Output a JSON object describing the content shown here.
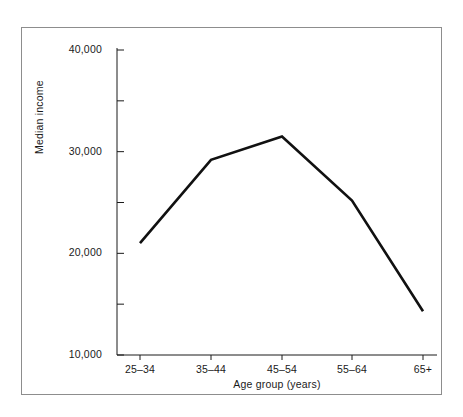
{
  "chart_data": {
    "type": "line",
    "title": "",
    "xlabel": "Age group (years)",
    "ylabel": "Median income",
    "categories": [
      "25–34",
      "35–44",
      "45–54",
      "55–64",
      "65+"
    ],
    "values": [
      21000,
      29200,
      31500,
      25200,
      14300
    ],
    "series": [
      {
        "name": "Median income",
        "values": [
          21000,
          29200,
          31500,
          25200,
          14300
        ]
      }
    ],
    "ylim": [
      10000,
      40000
    ],
    "ytick_values": [
      10000,
      20000,
      30000,
      40000
    ],
    "ytick_labels": [
      "10,000",
      "20,000",
      "30,000",
      "40,000"
    ],
    "yminor_tick_values": [
      15000,
      25000,
      35000
    ],
    "grid": false,
    "legend": false,
    "legend_position": "none",
    "line_color": "#111111",
    "frame_color": "#8d8d8d",
    "background_color": "#ffffff"
  },
  "axes": {
    "y_label_text": "Median income",
    "x_label_text": "Age group (years)"
  }
}
